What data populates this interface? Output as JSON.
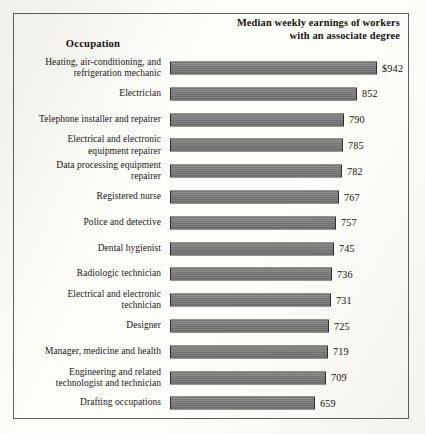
{
  "figure": {
    "occupation_header": "Occupation",
    "value_header_line1": "Median weekly earnings of workers",
    "value_header_line2": "with an associate degree",
    "bar_color": "#787878",
    "bar_outline_color": "#2e2e2e",
    "frame_color": "#5c5c5c",
    "background_color": "#fdfdfa"
  },
  "chart_data": {
    "type": "bar",
    "orientation": "horizontal",
    "title": "Median weekly earnings of workers with an associate degree",
    "xlabel": "",
    "ylabel": "Occupation",
    "grid": false,
    "legend": "none",
    "xlim": [
      0,
      942
    ],
    "value_prefix_first": "$",
    "categories": [
      "Heating, air-conditioning, and refrigeration mechanic",
      "Electrician",
      "Telephone installer and repairer",
      "Electrical and electronic equipment repairer",
      "Data processing equipment repairer",
      "Registered nurse",
      "Police and detective",
      "Dental hygienist",
      "Radiologic technician",
      "Electrical and electronic technician",
      "Designer",
      "Manager, medicine and health",
      "Engineering and related technologist and technician",
      "Drafting occupations"
    ],
    "values": [
      942,
      852,
      790,
      785,
      782,
      767,
      757,
      745,
      736,
      731,
      725,
      719,
      709,
      659
    ]
  },
  "rows": [
    {
      "label_lines": [
        "Heating, air-conditioning, and",
        "refrigeration mechanic"
      ],
      "value": 942,
      "value_label": "$942"
    },
    {
      "label_lines": [
        "Electrician"
      ],
      "value": 852,
      "value_label": "852"
    },
    {
      "label_lines": [
        "Telephone installer and repairer"
      ],
      "value": 790,
      "value_label": "790"
    },
    {
      "label_lines": [
        "Electrical and electronic",
        "equipment repairer"
      ],
      "value": 785,
      "value_label": "785"
    },
    {
      "label_lines": [
        "Data processing equipment",
        "repairer"
      ],
      "value": 782,
      "value_label": "782"
    },
    {
      "label_lines": [
        "Registered nurse"
      ],
      "value": 767,
      "value_label": "767"
    },
    {
      "label_lines": [
        "Police and detective"
      ],
      "value": 757,
      "value_label": "757"
    },
    {
      "label_lines": [
        "Dental hygienist"
      ],
      "value": 745,
      "value_label": "745"
    },
    {
      "label_lines": [
        "Radiologic technician"
      ],
      "value": 736,
      "value_label": "736"
    },
    {
      "label_lines": [
        "Electrical and electronic",
        "technician"
      ],
      "value": 731,
      "value_label": "731"
    },
    {
      "label_lines": [
        "Designer"
      ],
      "value": 725,
      "value_label": "725"
    },
    {
      "label_lines": [
        "Manager, medicine and health"
      ],
      "value": 719,
      "value_label": "719"
    },
    {
      "label_lines": [
        "Engineering and related",
        "technologist and technician"
      ],
      "value": 709,
      "value_label": "709"
    },
    {
      "label_lines": [
        "Drafting occupations"
      ],
      "value": 659,
      "value_label": "659"
    }
  ]
}
